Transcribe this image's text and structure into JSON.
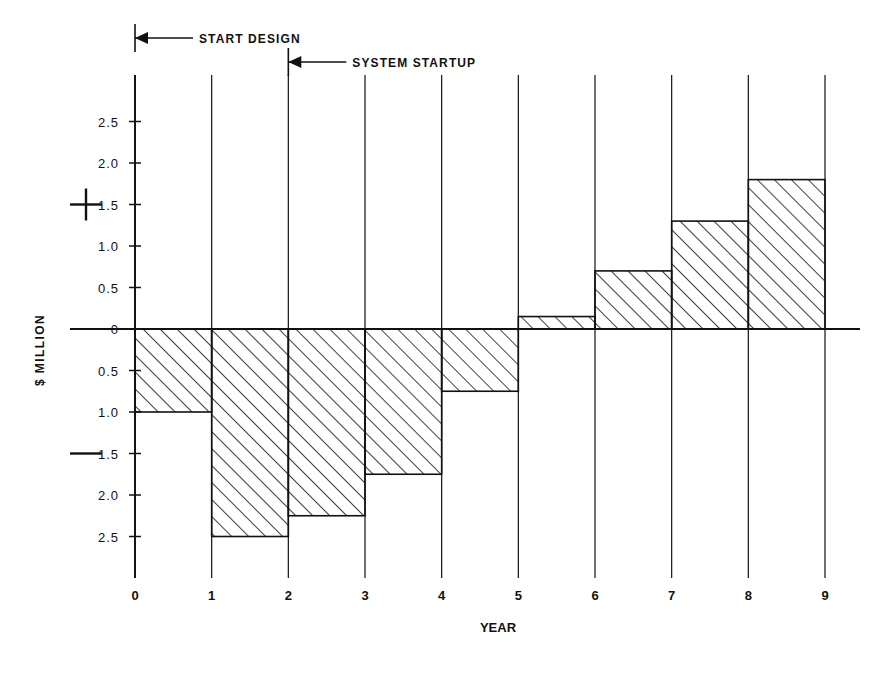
{
  "chart_data": {
    "type": "bar",
    "title": "",
    "subtitle": "",
    "xlabel": "YEAR",
    "ylabel": "$ MILLION",
    "categories": [
      "0-1",
      "1-2",
      "2-3",
      "3-4",
      "4-5",
      "5-6",
      "6-7",
      "7-8",
      "8-9"
    ],
    "x": [
      0,
      1,
      2,
      3,
      4,
      5,
      6,
      7,
      8,
      9
    ],
    "values": [
      -1.0,
      -2.5,
      -2.25,
      -1.75,
      -0.75,
      0.15,
      0.7,
      1.3,
      1.8
    ],
    "xlim": [
      0,
      9
    ],
    "ylim": [
      -2.75,
      2.75
    ],
    "grid": false,
    "legend": null,
    "x_ticks": [
      "0",
      "1",
      "2",
      "3",
      "4",
      "5",
      "6",
      "7",
      "8",
      "9"
    ],
    "y_ticks": [
      "2.5",
      "2.0",
      "1.5",
      "1.0",
      "0.5",
      "0",
      "0.5",
      "1.0",
      "1.5",
      "2.0",
      "2.5"
    ],
    "y_tick_values": [
      2.5,
      2.0,
      1.5,
      1.0,
      0.5,
      0,
      -0.5,
      -1.0,
      -1.5,
      -2.0,
      -2.5
    ],
    "sign_markers": [
      {
        "symbol": "+",
        "value": 1.5
      },
      {
        "symbol": "—",
        "value": -1.5
      }
    ],
    "bar_fill": "hatch-45",
    "line_color": "#111111",
    "annotations": [
      {
        "text": "START DESIGN",
        "x": 0,
        "arrow": "left"
      },
      {
        "text": "SYSTEM  STARTUP",
        "x": 2,
        "arrow": "left"
      }
    ]
  },
  "axis": {
    "y_title": "$ MILLION",
    "x_title": "YEAR"
  },
  "annotations": {
    "start_design": "START DESIGN",
    "system_startup": "SYSTEM  STARTUP"
  },
  "colors": {
    "ink": "#111111",
    "background": "#ffffff"
  }
}
